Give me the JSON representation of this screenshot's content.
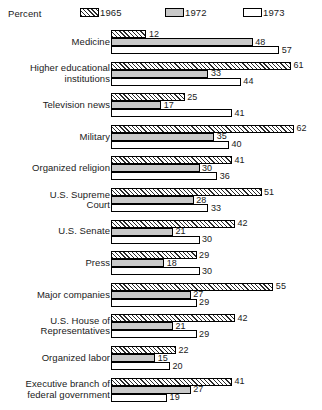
{
  "chart_data": {
    "type": "bar",
    "orientation": "horizontal",
    "title": "",
    "xlabel": "Percent",
    "ylabel": "",
    "xlim": [
      0,
      62
    ],
    "grid": false,
    "legend_position": "top",
    "axis_unit_label": "Percent",
    "series": [
      {
        "name": "1965",
        "swatch": "hatched",
        "values": [
          12,
          61,
          25,
          62,
          41,
          51,
          42,
          29,
          55,
          42,
          22,
          41
        ]
      },
      {
        "name": "1972",
        "swatch": "gray",
        "values": [
          48,
          33,
          17,
          35,
          30,
          28,
          21,
          18,
          27,
          21,
          15,
          27
        ]
      },
      {
        "name": "1973",
        "swatch": "white",
        "values": [
          57,
          44,
          41,
          40,
          36,
          33,
          30,
          30,
          29,
          29,
          20,
          19
        ]
      }
    ],
    "categories": [
      "Medicine",
      "Higher educational\ninstitutions",
      "Television news",
      "Military",
      "Organized religion",
      "U.S. Supreme\nCourt",
      "U.S. Senate",
      "Press",
      "Major companies",
      "U.S. House of\nRepresentatives",
      "Organized labor",
      "Executive branch of\nfederal government"
    ],
    "colors": {
      "hatch_line": "#2b2b2b",
      "gray_fill": "#c9c9c9",
      "white_fill": "#ffffff",
      "outline": "#000000",
      "text": "#1a1a1a",
      "background": "#ffffff"
    }
  },
  "legend": {
    "title": "Percent",
    "entries": [
      {
        "label": "1965",
        "swatch": "hatched"
      },
      {
        "label": "1972",
        "swatch": "gray"
      },
      {
        "label": "1973",
        "swatch": "white"
      }
    ]
  }
}
